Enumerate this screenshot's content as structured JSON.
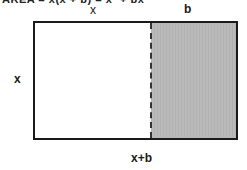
{
  "diagram": {
    "title": "AREA = x(x + b) = x² + bx",
    "labels": {
      "top_left_segment": "x",
      "top_right_segment": "b",
      "left_side": "x",
      "bottom": "x+b"
    },
    "regions": [
      {
        "name": "square",
        "dimensions": "x by x",
        "fill": "#ffffff"
      },
      {
        "name": "strip",
        "dimensions": "b by x",
        "fill": "#b9b9b9"
      }
    ],
    "colors": {
      "outline": "#1a1a1a",
      "shaded": "#b9b9b9",
      "background": "#ffffff"
    }
  }
}
